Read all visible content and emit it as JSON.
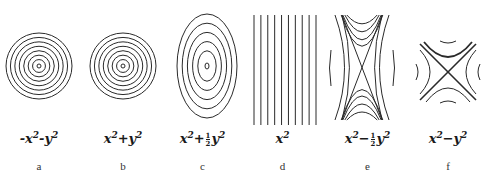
{
  "figure": {
    "panels": [
      {
        "id": "a",
        "letter": "a",
        "formula_prefix": "-x",
        "formula_sup1": "2",
        "formula_mid": "-y",
        "formula_sup2": "2",
        "contour_type": "concentric-circles",
        "levels": 8
      },
      {
        "id": "b",
        "letter": "b",
        "formula_prefix": "x",
        "formula_sup1": "2",
        "formula_mid": "+y",
        "formula_sup2": "2",
        "contour_type": "concentric-circles",
        "levels": 8
      },
      {
        "id": "c",
        "letter": "c",
        "formula_prefix": "x",
        "formula_sup1": "2",
        "formula_mid1": "+",
        "frac_num": "1",
        "frac_den": "2",
        "formula_mid2": "y",
        "formula_sup2": "2",
        "contour_type": "concentric-ellipses",
        "levels": 6
      },
      {
        "id": "d",
        "letter": "d",
        "formula_prefix": "x",
        "formula_sup1": "2",
        "contour_type": "parallel-lines",
        "levels": 10
      },
      {
        "id": "e",
        "letter": "e",
        "formula_prefix": "x",
        "formula_sup1": "2",
        "formula_mid1": "−",
        "frac_num": "1",
        "frac_den": "2",
        "formula_mid2": "y",
        "formula_sup2": "2",
        "contour_type": "hyperbolas-narrow",
        "levels": 4
      },
      {
        "id": "f",
        "letter": "f",
        "formula_prefix": "x",
        "formula_sup1": "2",
        "formula_mid": "−y",
        "formula_sup2": "2",
        "contour_type": "hyperbolas-square",
        "levels": 3
      }
    ],
    "line_color": "#2a2a2a"
  }
}
